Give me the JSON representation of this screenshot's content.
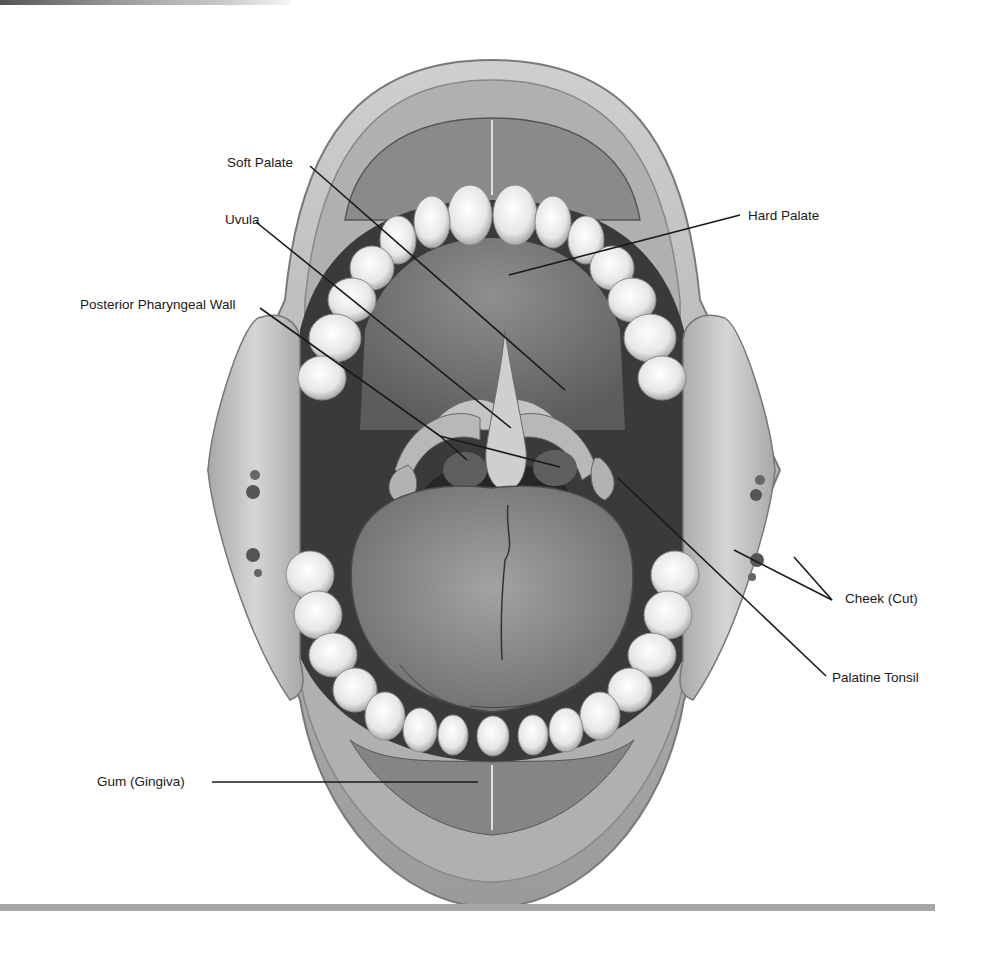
{
  "figure": {
    "labels": [
      {
        "id": "soft-palate",
        "text": "Soft Palate",
        "x": 227,
        "y": 155,
        "target": [
          565,
          390
        ]
      },
      {
        "id": "uvula",
        "text": "Uvula",
        "x": 225,
        "y": 212,
        "target": [
          511,
          428
        ]
      },
      {
        "id": "hard-palate",
        "text": "Hard Palate",
        "x": 748,
        "y": 208,
        "target": [
          509,
          275
        ]
      },
      {
        "id": "posterior-pharyngeal-wall",
        "text": "Posterior Pharyngeal Wall",
        "x": 80,
        "y": 297,
        "target_a": [
          467,
          460
        ],
        "target_b": [
          560,
          467
        ]
      },
      {
        "id": "cheek-cut",
        "text": "Cheek (Cut)",
        "x": 845,
        "y": 591,
        "target_a": [
          734,
          550
        ],
        "target_b": [
          794,
          557
        ]
      },
      {
        "id": "palatine-tonsil",
        "text": "Palatine Tonsil",
        "x": 832,
        "y": 670,
        "target": [
          618,
          478
        ]
      },
      {
        "id": "gum-gingiva",
        "text": "Gum (Gingiva)",
        "x": 97,
        "y": 774,
        "target": [
          478,
          782
        ]
      }
    ]
  },
  "colors": {
    "line": "#1a1a1a",
    "rule": "#a8a8a8",
    "lip": "#bdbdbd",
    "teeth": "#f2f2f2",
    "tongue": "#8e8e8e",
    "palate": "#7a7a7a",
    "throat": "#2a2a2a",
    "cheek": "#c9c9c9"
  }
}
